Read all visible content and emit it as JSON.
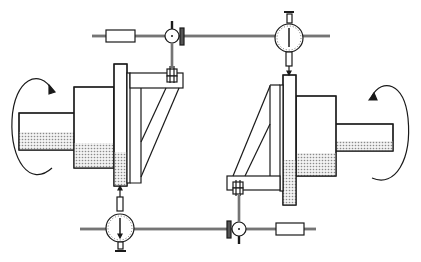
{
  "diagram": {
    "title": "Shaft alignment with rim-and-face dial indicators",
    "colors": {
      "line": "#1a1a1a",
      "shade": "#bdbdbd",
      "background": "#ffffff"
    },
    "components": [
      {
        "id": "left-shaft",
        "label": "Left shaft"
      },
      {
        "id": "left-hub",
        "label": "Left coupling hub"
      },
      {
        "id": "left-flange",
        "label": "Left flange"
      },
      {
        "id": "left-bracket",
        "label": "Left indicator bracket"
      },
      {
        "id": "right-shaft",
        "label": "Right shaft"
      },
      {
        "id": "right-hub",
        "label": "Right coupling hub"
      },
      {
        "id": "right-flange",
        "label": "Right flange"
      },
      {
        "id": "right-bracket",
        "label": "Right indicator bracket"
      },
      {
        "id": "top-dial",
        "label": "Top dial indicator"
      },
      {
        "id": "bottom-dial",
        "label": "Bottom dial indicator"
      },
      {
        "id": "top-rod",
        "label": "Top indicator rod with clamp and weight"
      },
      {
        "id": "bottom-rod",
        "label": "Bottom indicator rod with clamp and weight"
      },
      {
        "id": "left-rotation-arrow",
        "label": "Rotation direction (left shaft)"
      },
      {
        "id": "right-rotation-arrow",
        "label": "Rotation direction (right shaft)"
      }
    ]
  }
}
